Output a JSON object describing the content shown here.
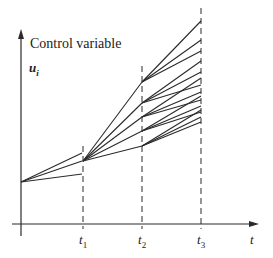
{
  "diagram": {
    "y_axis_label": "Control variable",
    "y_symbol": "u",
    "y_symbol_sub": "i",
    "x_axis_label": "t",
    "time_marks": [
      {
        "label": "t",
        "sub": "1"
      },
      {
        "label": "t",
        "sub": "2"
      },
      {
        "label": "t",
        "sub": "3"
      }
    ],
    "colors": {
      "line": "#2a2a2a",
      "background": "#ffffff"
    }
  }
}
